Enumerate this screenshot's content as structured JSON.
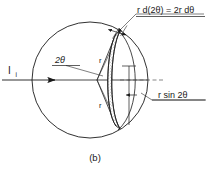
{
  "figure": {
    "caption": "(b)",
    "title_note": "Scattering geometry diagram: annular band of width r d(2theta) on a sphere",
    "labels": {
      "incident_beam": "I",
      "incident_beam_subscript": "i",
      "angle": "2θ",
      "radius_upper": "r",
      "radius_lower": "r",
      "arc_width": "r d(2θ) = 2r dθ",
      "vertical_extent": "r sin 2θ"
    },
    "colors": {
      "ink": "#1a1a1a",
      "hairline": "#2a2a2a",
      "dashed": "#555555",
      "stipple": "#6e6e6e",
      "background": "#ffffff"
    },
    "geometry": {
      "circle_center_x": 90,
      "circle_center_y": 80,
      "circle_radius": 58,
      "cone_vertex_x": 97,
      "cone_vertex_y": 80,
      "axis_y": 80,
      "axis_start_x": 2,
      "axis_end_x": 148
    }
  }
}
